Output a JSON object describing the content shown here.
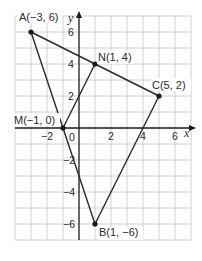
{
  "diagram": {
    "type": "coordinate-plane",
    "x_axis_label": "x",
    "y_axis_label": "y",
    "origin_label": "0",
    "x_ticks": [
      {
        "value": -2,
        "label": "−2"
      },
      {
        "value": 2,
        "label": "2"
      },
      {
        "value": 4,
        "label": "4"
      },
      {
        "value": 6,
        "label": "6"
      }
    ],
    "y_ticks": [
      {
        "value": 6,
        "label": "6"
      },
      {
        "value": 4,
        "label": "4"
      },
      {
        "value": 2,
        "label": "2"
      },
      {
        "value": -2,
        "label": "−2"
      },
      {
        "value": -4,
        "label": "−4"
      },
      {
        "value": -6,
        "label": "−6"
      }
    ],
    "grid": {
      "x_min": -4,
      "x_max": 7,
      "y_min": -7,
      "y_max": 7,
      "step": 1
    },
    "points": [
      {
        "name": "A",
        "x": -3,
        "y": 6,
        "label": "A(−3, 6)"
      },
      {
        "name": "B",
        "x": 1,
        "y": -6,
        "label": "B(1, −6)"
      },
      {
        "name": "C",
        "x": 5,
        "y": 2,
        "label": "C(5, 2)"
      },
      {
        "name": "M",
        "x": -1,
        "y": 0,
        "label": "M(−1, 0)"
      },
      {
        "name": "N",
        "x": 1,
        "y": 4,
        "label": "N(1, 4)"
      }
    ],
    "segments": [
      [
        "A",
        "C"
      ],
      [
        "A",
        "M"
      ],
      [
        "M",
        "B"
      ],
      [
        "B",
        "C"
      ],
      [
        "M",
        "N"
      ]
    ]
  }
}
